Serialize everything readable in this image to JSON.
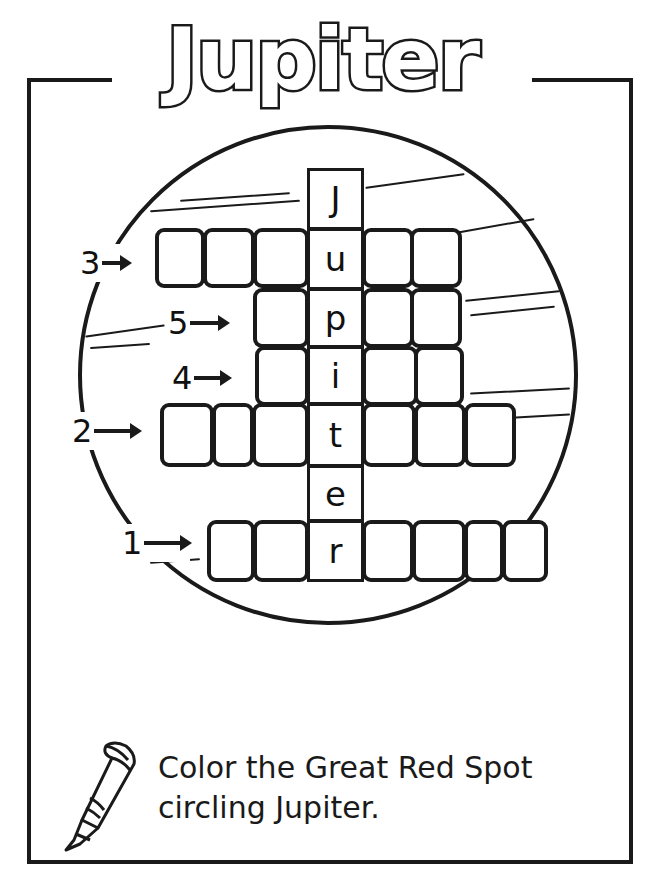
{
  "title": "Jupiter",
  "puzzle": {
    "vertical_word": [
      "J",
      "u",
      "p",
      "i",
      "t",
      "e",
      "r"
    ],
    "clues": [
      {
        "number": "3",
        "row_letter": "u"
      },
      {
        "number": "5",
        "row_letter": "p"
      },
      {
        "number": "4",
        "row_letter": "i"
      },
      {
        "number": "2",
        "row_letter": "t"
      },
      {
        "number": "1",
        "row_letter": "r"
      }
    ]
  },
  "instructions": {
    "line1": "Color the Great Red Spot",
    "line2": "circling Jupiter."
  },
  "icons": {
    "crayon": "crayon-icon",
    "arrow": "arrow-right-icon"
  },
  "colors": {
    "ink": "#1a1a1a",
    "paper": "#ffffff"
  }
}
